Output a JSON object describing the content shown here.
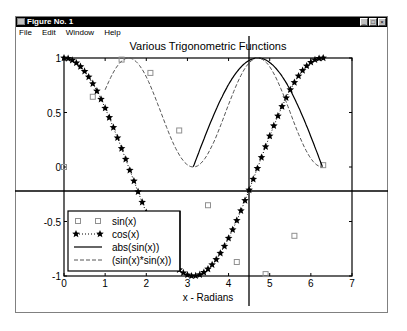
{
  "window": {
    "title": "Figure No. 1",
    "buttons": [
      "minimize",
      "maximize",
      "close"
    ]
  },
  "menubar": {
    "items": [
      {
        "label": "File"
      },
      {
        "label": "Edit"
      },
      {
        "label": "Window"
      },
      {
        "label": "Help"
      }
    ]
  },
  "crosshair": {
    "x_px": 249,
    "y_px": 191
  },
  "chart_data": {
    "type": "line",
    "title": "Various Trigonometric Functions",
    "xlabel": "x - Radians",
    "ylabel": "",
    "xlim": [
      0,
      7
    ],
    "ylim": [
      -1,
      1
    ],
    "xticks": [
      0,
      1,
      2,
      3,
      4,
      5,
      6,
      7
    ],
    "yticks": [
      -1,
      -0.5,
      0,
      0.5,
      1
    ],
    "ytick_labels": [
      "-1",
      "-0.5",
      "0",
      "0.5",
      "1"
    ],
    "grid": false,
    "legend_position": "lower left",
    "series": [
      {
        "name": "sin(x)",
        "style": "square-markers",
        "x": [
          0,
          0.7,
          1.4,
          2.1,
          2.8,
          3.5,
          4.2,
          4.9,
          5.6,
          6.3
        ],
        "y": [
          0,
          0.64,
          0.99,
          0.86,
          0.33,
          -0.35,
          -0.87,
          -0.98,
          -0.63,
          0.02
        ]
      },
      {
        "name": "cos(x)",
        "style": "dotted-star",
        "x_range": [
          0,
          6.3
        ],
        "x_step": 0.1,
        "function": "cos"
      },
      {
        "name": "abs(sin(x))",
        "style": "solid",
        "x_range": [
          3.14,
          6.28
        ],
        "function": "abs_sin"
      },
      {
        "name": "(sin(x)*sin(x))",
        "style": "dashed",
        "x_range": [
          1.0,
          6.28
        ],
        "function": "sin_sq"
      }
    ],
    "legend_labels": [
      "sin(x)",
      "cos(x)",
      "abs(sin(x))",
      "(sin(x)*sin(x))"
    ]
  }
}
